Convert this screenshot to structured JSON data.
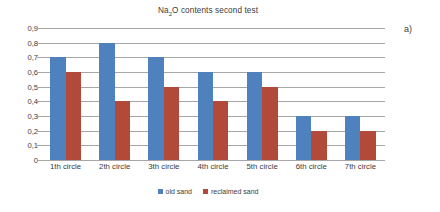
{
  "panel_label": "a)",
  "title_parts": {
    "prefix": "Na",
    "subscript": "2",
    "suffix": "O contents second test"
  },
  "title_plain": "Na2O contents second test",
  "legend": {
    "entries": [
      {
        "label": "old sand",
        "color": "#4e81bd",
        "swatch": "old"
      },
      {
        "label": "reclaimed sand",
        "color": "#b14a38",
        "swatch": "reclaimed"
      }
    ]
  },
  "chart_data": {
    "type": "bar",
    "title": "Na2O contents second test",
    "xlabel": "",
    "ylabel": "",
    "ylim": [
      0,
      0.9
    ],
    "ytick_step": 0.1,
    "grid": true,
    "legend_position": "bottom",
    "decimal_separator": ",",
    "categories": [
      "1th circle",
      "2th circle",
      "3th circle",
      "4th circle",
      "5th circle",
      "6th circle",
      "7th circle"
    ],
    "ytick_labels": [
      "0,9",
      "0,8",
      "0,7",
      "0,6",
      "0,5",
      "0,4",
      "0,3",
      "0,2",
      "0,1",
      "0"
    ],
    "ytick_values": [
      0.9,
      0.8,
      0.7,
      0.6,
      0.5,
      0.4,
      0.3,
      0.2,
      0.1,
      0
    ],
    "series": [
      {
        "name": "old sand",
        "color": "#4e81bd",
        "values": [
          0.7,
          0.8,
          0.7,
          0.6,
          0.6,
          0.3,
          0.3
        ]
      },
      {
        "name": "reclaimed sand",
        "color": "#b14a38",
        "values": [
          0.6,
          0.4,
          0.5,
          0.4,
          0.5,
          0.2,
          0.2
        ]
      }
    ]
  }
}
